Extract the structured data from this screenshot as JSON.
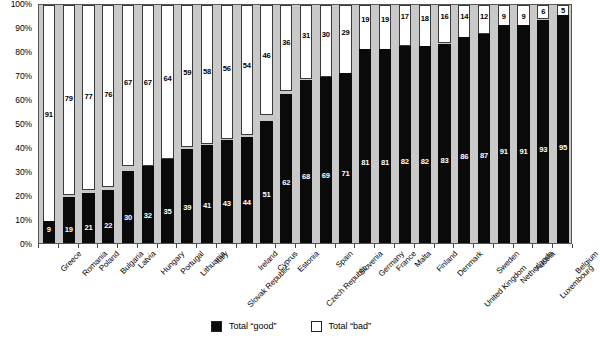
{
  "chart_data": {
    "type": "bar",
    "subtype": "100% stacked bar",
    "title": "",
    "subtitle": "",
    "xlabel": "",
    "ylabel": "",
    "ylim": [
      0,
      100
    ],
    "yticks": [
      "0%",
      "10%",
      "20%",
      "30%",
      "40%",
      "50%",
      "60%",
      "70%",
      "80%",
      "90%",
      "100%"
    ],
    "grid": false,
    "legend_position": "bottom-center",
    "categories": [
      "Greece",
      "Romania",
      "Poland",
      "Bulgaria",
      "Latvia",
      "Hungary",
      "Portugal",
      "Lithuania",
      "Italy",
      "Slovak Republic",
      "Ireland",
      "Cyprus",
      "Estonia",
      "Czech Republic",
      "Spain",
      "Slovenia",
      "Germany",
      "France",
      "Malta",
      "Finland",
      "Denmark",
      "United Kingdom",
      "Sweden",
      "Netherlands",
      "Austria",
      "Luxembourg",
      "Belgium"
    ],
    "series": [
      {
        "name": "Total “good”",
        "color": "#0a0a0a",
        "values": [
          9,
          19,
          21,
          22,
          30,
          32,
          35,
          39,
          41,
          43,
          44,
          51,
          62,
          68,
          69,
          71,
          81,
          81,
          82,
          82,
          83,
          86,
          87,
          91,
          91,
          93,
          95
        ]
      },
      {
        "name": "Total “bad”",
        "color": "#ffffff",
        "values": [
          91,
          79,
          77,
          76,
          67,
          67,
          64,
          59,
          58,
          56,
          54,
          46,
          36,
          31,
          30,
          29,
          19,
          19,
          17,
          18,
          16,
          14,
          12,
          9,
          9,
          6,
          5
        ]
      }
    ]
  },
  "legend": {
    "items": [
      {
        "label": "Total “good”",
        "swatch": "black-square"
      },
      {
        "label": "Total “bad”",
        "swatch": "white-square"
      }
    ]
  }
}
